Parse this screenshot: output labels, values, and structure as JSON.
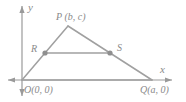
{
  "figure": {
    "kind": "coordinate-geometry-diagram",
    "colors": {
      "line": "#999999",
      "axis": "#9a9a9a",
      "label": "#8a8a8a",
      "point": "#8f8f8f",
      "background": "#ffffff"
    }
  },
  "axes": {
    "x_label": "x",
    "y_label": "y",
    "origin_px": {
      "x": 22,
      "y": 80
    },
    "x_axis_from_px": {
      "x": 8,
      "y": 80
    },
    "x_axis_to_px": {
      "x": 172,
      "y": 80
    },
    "y_axis_from_px": {
      "x": 22,
      "y": 96
    },
    "y_axis_to_px": {
      "x": 22,
      "y": 6
    },
    "arrowheads": [
      "x-positive",
      "x-negative",
      "y-positive",
      "y-negative"
    ]
  },
  "points": {
    "O": {
      "label": "O(0, 0)",
      "name": "O",
      "coords": "(0, 0)",
      "px": {
        "x": 22,
        "y": 80
      }
    },
    "P": {
      "label": "P (b, c)",
      "name": "P",
      "coords": "(b, c)",
      "px": {
        "x": 68,
        "y": 26
      }
    },
    "Q": {
      "label": "Q(a, 0)",
      "name": "Q",
      "coords": "(a, 0)",
      "px": {
        "x": 152,
        "y": 80
      }
    },
    "R": {
      "label": "R",
      "name": "R",
      "coords": "",
      "px": {
        "x": 45,
        "y": 53
      }
    },
    "S": {
      "label": "S",
      "name": "S",
      "coords": "",
      "px": {
        "x": 110,
        "y": 53
      }
    }
  },
  "segments": [
    {
      "name": "OP",
      "from": "O",
      "to": "P"
    },
    {
      "name": "PQ",
      "from": "P",
      "to": "Q"
    },
    {
      "name": "OQ",
      "from": "O",
      "to": "Q"
    },
    {
      "name": "RS",
      "from": "R",
      "to": "S"
    }
  ],
  "markers": [
    {
      "name": "point-R-dot",
      "px": {
        "x": 45,
        "y": 53
      }
    },
    {
      "name": "point-S-dot",
      "px": {
        "x": 110,
        "y": 53
      }
    }
  ]
}
